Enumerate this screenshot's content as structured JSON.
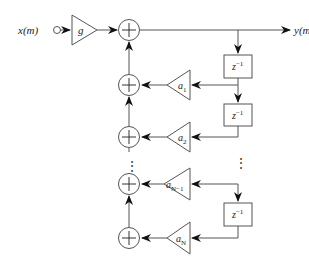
{
  "diagram": {
    "type": "all-pole IIR filter block diagram",
    "input": {
      "label": "x(m)"
    },
    "output": {
      "label": "y(m)"
    },
    "gain": {
      "label": "g"
    },
    "delay_label": "z",
    "delay_exp": "−1",
    "coefficients": [
      {
        "base": "a",
        "sub": "1"
      },
      {
        "base": "a",
        "sub": "2"
      },
      {
        "base": "a",
        "sub": "N−1"
      },
      {
        "base": "a",
        "sub": "N"
      }
    ],
    "ellipsis": "⋮",
    "colors": {
      "stroke": "#555555",
      "fill": "#ffffff",
      "text": "#222222"
    }
  }
}
